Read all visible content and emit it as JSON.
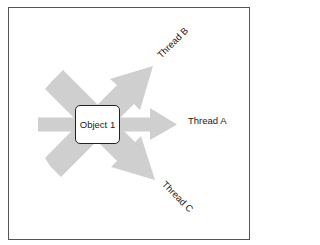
{
  "diagram": {
    "object": {
      "label": "Object 1"
    },
    "threads": [
      {
        "id": "A",
        "label": "Thread A",
        "direction": "right"
      },
      {
        "id": "B",
        "label": "Thread B",
        "direction": "up-right"
      },
      {
        "id": "C",
        "label": "Thread C",
        "direction": "down-right"
      }
    ],
    "colors": {
      "arrow_fill": "#cfcfcf",
      "frame_border": "#555555",
      "box_border": "#222222",
      "text": "#222222"
    }
  }
}
